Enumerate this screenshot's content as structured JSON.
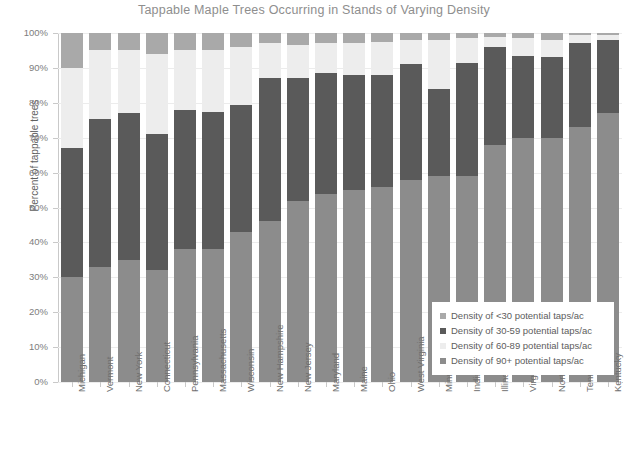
{
  "chart_data": {
    "type": "bar",
    "subtype": "stacked-bar-100-percent",
    "title": "Tappable Maple Trees Occurring in Stands of Varying Density",
    "xlabel": "",
    "ylabel": "Percent of tappable trees",
    "ylim": [
      0,
      100
    ],
    "ytick_labels": [
      "0%",
      "10%",
      "20%",
      "30%",
      "40%",
      "50%",
      "60%",
      "70%",
      "80%",
      "90%",
      "100%"
    ],
    "ytick_values": [
      0,
      10,
      20,
      30,
      40,
      50,
      60,
      70,
      80,
      90,
      100
    ],
    "grid": true,
    "legend_position": "lower-right-inside",
    "stack_order_bottom_to_top": [
      "Density of 90+ potential taps/ac",
      "Density of 60-89 potential taps/ac",
      "Density of 30-59 potential taps/ac",
      "Density of <30 potential taps/ac"
    ],
    "categories": [
      "Michigan",
      "Vermont",
      "New York",
      "Connecticut",
      "Pennsylvania",
      "Massachusetts",
      "Wisconsin",
      "New Hampshire",
      "New Jersey",
      "Maryland",
      "Maine",
      "Ohio",
      "West Virginia",
      "Minnesota",
      "Indiana",
      "Illinois",
      "Virginia",
      "North Carolina",
      "Tennessee",
      "Kentucky"
    ],
    "series": [
      {
        "name": "Density of 90+ potential taps/ac",
        "color": "#8c8c8c",
        "values": [
          30,
          33,
          35,
          32,
          38,
          38,
          43,
          46,
          52,
          54,
          55,
          56,
          58,
          59,
          59,
          68,
          70,
          70,
          73,
          77
        ]
      },
      {
        "name": "Density of 30-59 potential taps/ac",
        "color": "#5a5a5a",
        "values": [
          37,
          42.5,
          42,
          39,
          40,
          39.5,
          36.5,
          41,
          35,
          34.5,
          33,
          32,
          33,
          25,
          32.5,
          28,
          23.5,
          23,
          24,
          21
        ]
      },
      {
        "name": "Density of 60-89 potential taps/ac",
        "color": "#ededed",
        "values": [
          23,
          19.5,
          18,
          23,
          17,
          17.5,
          16.5,
          10,
          9.5,
          8.5,
          9,
          9.5,
          7,
          14,
          7,
          3,
          5,
          5,
          2.5,
          1.5
        ]
      },
      {
        "name": "Density of <30 potential taps/ac",
        "color": "#a9a9a9",
        "values": [
          10,
          5,
          5,
          6,
          5,
          5,
          4,
          3,
          3.5,
          3,
          3,
          2.5,
          2,
          2,
          1.5,
          1,
          1.5,
          2,
          0.5,
          0.5
        ]
      }
    ],
    "legend_entries": [
      {
        "label": "Density of <30 potential taps/ac",
        "color": "#a9a9a9"
      },
      {
        "label": "Density of 30-59 potential taps/ac",
        "color": "#5a5a5a"
      },
      {
        "label": "Density of 60-89 potential taps/ac",
        "color": "#ededed"
      },
      {
        "label": "Density of 90+ potential taps/ac",
        "color": "#8c8c8c"
      }
    ]
  }
}
